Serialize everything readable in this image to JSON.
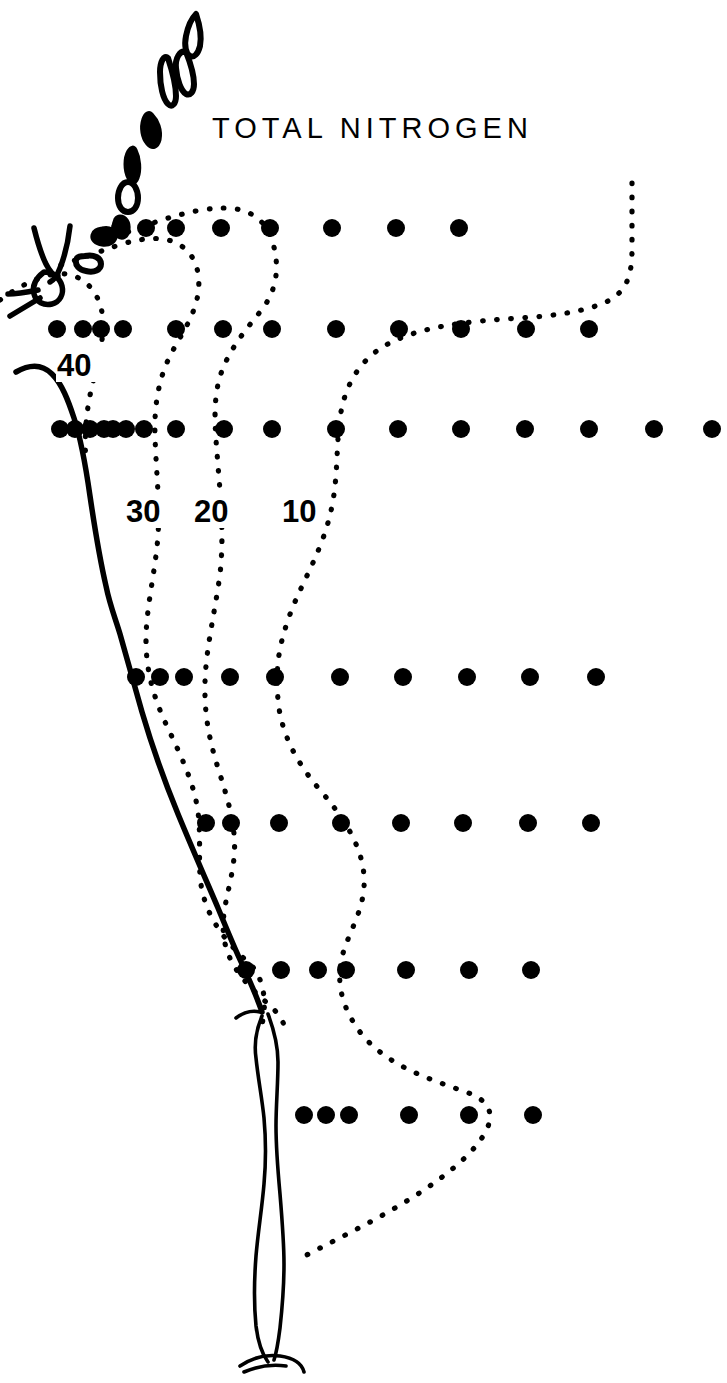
{
  "figure": {
    "title": "TOTAL NITROGEN",
    "type": "contour-map",
    "background_color": "#ffffff",
    "ink_color": "#000000"
  },
  "chart_data": {
    "type": "contour-map",
    "title": "TOTAL NITROGEN",
    "xlabel": "",
    "ylabel": "",
    "grid": false,
    "legend_position": "none",
    "variable": "Total nitrogen",
    "contour_levels": [
      10,
      20,
      30,
      40
    ],
    "contour_labels": [
      {
        "value": "40",
        "x": 80,
        "y": 370
      },
      {
        "value": "30",
        "x": 147,
        "y": 516
      },
      {
        "value": "20",
        "x": 214,
        "y": 516
      },
      {
        "value": "10",
        "x": 300,
        "y": 516
      }
    ],
    "station_rows": [
      {
        "y": 228,
        "x": [
          120,
          146,
          176,
          221,
          270,
          332,
          396,
          459
        ]
      },
      {
        "y": 329,
        "x": [
          57,
          83,
          101,
          123,
          176,
          223,
          272,
          336,
          399,
          461,
          526,
          589
        ]
      },
      {
        "y": 429,
        "x": [
          60,
          75,
          90,
          104,
          113,
          126,
          144,
          176,
          224,
          272,
          336,
          398,
          461,
          525,
          589,
          654,
          712
        ]
      },
      {
        "y": 677,
        "x": [
          136,
          160,
          184,
          230,
          275,
          340,
          403,
          467,
          530,
          596
        ]
      },
      {
        "y": 823,
        "x": [
          206,
          231,
          279,
          341,
          401,
          463,
          528,
          591
        ]
      },
      {
        "y": 970,
        "x": [
          246,
          281,
          318,
          346,
          406,
          469,
          531
        ]
      },
      {
        "y": 1115,
        "x": [
          304,
          326,
          349,
          409,
          469,
          533
        ]
      }
    ],
    "station_dot_radius": 9
  },
  "paths": {
    "contour_10": "M 632,183 L 632,250 C 632,278 625,292 608,301 C 588,311 555,316 520,318 C 470,321 420,326 386,345 C 356,362 344,390 340,418 C 336,449 338,476 332,506 C 323,552 300,584 288,620 C 277,652 276,672 278,700 C 281,733 296,762 320,790 C 344,818 362,846 364,876 C 366,905 352,926 344,950 C 335,978 340,1005 360,1032 C 386,1066 432,1080 466,1092 C 489,1100 495,1113 486,1131 C 470,1162 420,1195 372,1221 C 336,1240 312,1252 301,1258",
    "contour_20": "M 128,232 C 170,216 200,208 224,208 C 249,208 265,219 272,240 C 280,265 278,290 260,312 C 243,333 226,354 219,380 C 212,408 216,437 218,466 C 221,502 224,538 220,574 C 215,612 206,648 205,682 C 204,716 210,742 218,768 C 228,800 237,828 234,858 C 231,888 220,912 224,938 C 228,966 248,986 266,1002 C 279,1013 286,1024 286,1035",
    "contour_30": "M 61,265 C 88,256 104,250 122,244 C 146,237 166,236 180,245 C 196,255 201,274 198,294 C 194,318 180,336 170,356 C 158,380 154,408 155,436 C 156,470 160,502 158,536 C 155,574 146,608 146,640 C 146,672 154,698 166,724 C 180,754 194,782 198,812 C 202,844 196,872 204,898 C 212,926 232,948 250,964 C 262,975 268,1000 262,1024",
    "contour_40": "M 0,300 C 14,290 26,283 40,278 C 56,272 70,272 82,280 C 96,289 103,306 103,324 C 103,344 98,362 93,382 C 86,410 84,436 86,462",
    "coast_main": "M 16,372 C 30,364 42,364 52,374 C 62,384 68,400 74,418 C 82,442 86,468 90,496 C 95,530 100,560 106,586 C 110,606 116,620 120,634 C 127,658 134,684 142,712 C 152,746 164,780 178,814 C 192,848 206,880 218,908 C 228,932 236,952 244,968 C 252,986 258,1000 262,1012",
    "coast_spit_left": "M 262,1016 C 256,1030 254,1044 256,1058 C 258,1078 262,1098 264,1118 C 266,1140 266,1162 264,1184 C 262,1208 258,1232 256,1256 C 254,1282 254,1306 256,1326 C 258,1342 262,1354 268,1362",
    "coast_spit_right": "M 268,1014 C 274,1030 278,1046 278,1062 C 278,1084 276,1104 276,1126 C 276,1150 278,1172 280,1194 C 282,1218 284,1242 284,1264 C 284,1288 282,1310 280,1328 C 278,1344 276,1354 274,1360",
    "coast_spit_tip": "M 240,1366 C 252,1358 266,1354 280,1356 C 294,1358 302,1364 304,1372",
    "coast_spit_tip2": "M 244,1372 C 258,1366 272,1364 286,1366",
    "coast_inlet_upper": "M 236,1018 C 244,1012 252,1010 260,1012",
    "coast_north_v": "M 34,228 C 38,244 42,256 46,264 C 50,272 54,276 58,276",
    "coast_north_v2": "M 70,226 C 68,244 64,258 60,268 C 57,276 54,280 50,282",
    "coast_north_hook": "M 44,272 C 36,278 32,286 34,294 C 36,302 44,306 52,304 C 60,302 64,294 62,286 C 60,278 52,272 44,272 Z",
    "coast_north_tail": "M 38,290 C 28,292 18,294 8,294",
    "coast_north_tail2": "M 40,298 C 30,304 20,310 10,316"
  },
  "islands": [
    {
      "name": "island-north-tip",
      "d": "M 196,14 C 200,26 202,36 200,46 C 198,54 194,58 190,56 C 186,54 184,46 186,36 C 188,26 192,18 196,14 Z"
    },
    {
      "name": "island-elongated-1",
      "d": "M 186,52 C 190,62 194,74 194,84 C 194,92 190,96 186,94 C 181,91 177,80 176,68 C 175,58 180,50 186,52 Z"
    },
    {
      "name": "island-elongated-2",
      "d": "M 168,58 C 172,70 176,84 176,96 C 176,104 172,108 168,104 C 163,99 160,86 160,72 C 160,62 164,54 168,58 Z"
    },
    {
      "name": "island-mid-1",
      "d": "M 152,114 C 158,120 162,130 160,140 C 158,148 152,150 147,144 C 142,138 140,128 143,119 C 145,113 149,111 152,114 Z"
    },
    {
      "name": "island-mid-2",
      "d": "M 136,150 C 140,158 141,170 138,178 C 136,184 131,184 128,178 C 124,170 124,158 128,151 C 131,146 134,146 136,150 Z"
    },
    {
      "name": "island-ring",
      "d": "M 128,182 C 134,182 138,190 138,198 C 138,206 134,212 128,212 C 122,212 118,206 118,198 C 118,190 122,182 128,182 Z"
    },
    {
      "name": "island-small-1",
      "d": "M 120,216 C 126,216 130,222 129,230 C 128,237 123,240 118,237 C 113,233 112,225 115,219 C 117,216 118,216 120,216 Z"
    },
    {
      "name": "island-small-2",
      "d": "M 102,228 C 110,226 116,230 116,236 C 116,242 110,246 102,245 C 95,244 91,240 92,235 C 93,230 97,229 102,228 Z"
    },
    {
      "name": "island-small-3",
      "d": "M 85,256 C 94,254 101,258 101,264 C 101,270 94,273 86,271 C 79,270 75,265 76,260 C 77,256 81,256 85,256 Z"
    }
  ],
  "dot_grid_label": "sampling-station"
}
